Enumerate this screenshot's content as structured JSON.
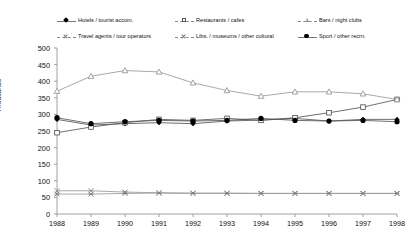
{
  "chart_data": {
    "type": "line",
    "title": "",
    "xlabel": "",
    "ylabel": "Thousands",
    "ylim": [
      0,
      500
    ],
    "ytick_step": 50,
    "grid": false,
    "legend_position": "top",
    "legend_columns": 3,
    "categories": [
      "1988",
      "1989",
      "1990",
      "1991",
      "1992",
      "1993",
      "1994",
      "1995",
      "1996",
      "1997",
      "1998"
    ],
    "yticks": [
      "0",
      "50",
      "100",
      "150",
      "200",
      "250",
      "300",
      "350",
      "400",
      "450",
      "500"
    ],
    "series": [
      {
        "name": "Hotels / tourist accom.",
        "marker": "filled-diamond",
        "values": [
          285,
          268,
          272,
          275,
          272,
          280,
          283,
          288,
          280,
          285,
          285
        ]
      },
      {
        "name": "Restaurants / cafes",
        "marker": "open-square",
        "values": [
          245,
          262,
          275,
          285,
          282,
          288,
          282,
          290,
          305,
          322,
          345
        ]
      },
      {
        "name": "Bars / night clubs",
        "marker": "open-triangle",
        "values": [
          370,
          415,
          432,
          428,
          395,
          372,
          355,
          368,
          368,
          362,
          345
        ]
      },
      {
        "name": "Travel agents / tour operators",
        "marker": "x",
        "values": [
          70,
          70,
          66,
          64,
          63,
          63,
          62,
          62,
          62,
          62,
          62
        ]
      },
      {
        "name": "Libs. / museums / other cultural",
        "marker": "star",
        "values": [
          60,
          60,
          62,
          63,
          62,
          62,
          62,
          62,
          62,
          62,
          62
        ]
      },
      {
        "name": "Sport / other recrn.",
        "marker": "filled-circle",
        "values": [
          290,
          272,
          278,
          282,
          280,
          282,
          288,
          282,
          280,
          282,
          278
        ]
      }
    ]
  },
  "legend": {
    "items": [
      {
        "label": "Hotels / tourist accom.",
        "marker": "filled-diamond",
        "line": "solid"
      },
      {
        "label": "Restaurants / cafes",
        "marker": "open-square",
        "line": "dashed"
      },
      {
        "label": "Bars / night clubs",
        "marker": "open-triangle",
        "line": "dashed"
      },
      {
        "label": "Travel agents / tour operators",
        "marker": "x",
        "line": "dashed"
      },
      {
        "label": "Libs. / museums / other cultural",
        "marker": "star",
        "line": "dashed"
      },
      {
        "label": "Sport / other recrn.",
        "marker": "filled-circle",
        "line": "solid"
      }
    ]
  },
  "colors": {
    "axis": "#8a8a8a",
    "text": "#111111",
    "line_dark": "#555555",
    "line_light": "#9a9a9a",
    "background": "#ffffff"
  }
}
